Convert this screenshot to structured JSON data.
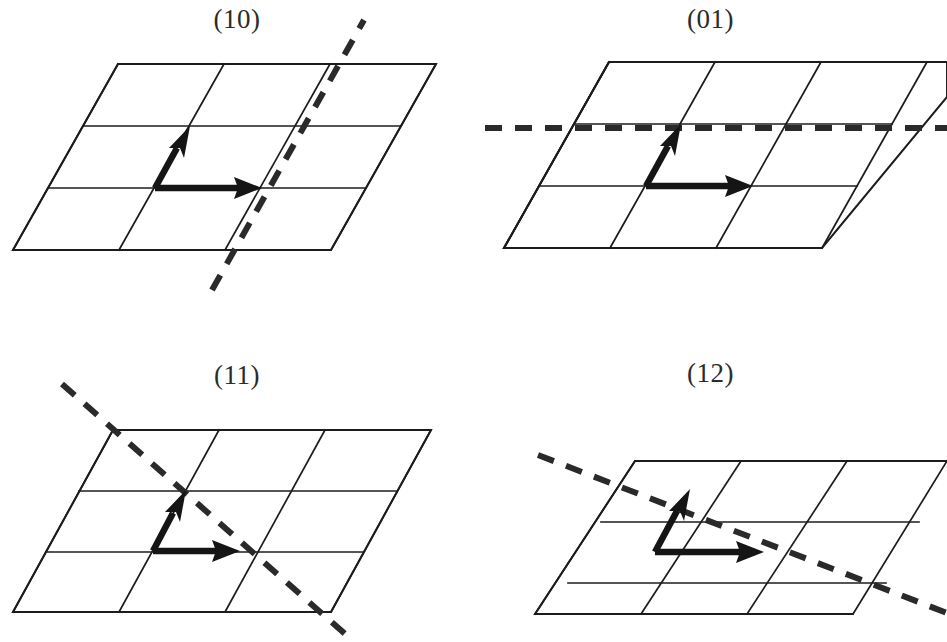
{
  "figure": {
    "type": "crystallographic-miller-index-diagram",
    "panel_count": 4,
    "columns": 2,
    "rows": 2
  },
  "style": {
    "background": "#ffffff",
    "lattice_stroke": "#1c1c1c",
    "trace_stroke": "#2a2a2a",
    "vector_fill": "#151515",
    "label_color": "#2b2b2b"
  },
  "lattice": {
    "cols": 3,
    "rows": 3,
    "cell_width": 106,
    "row_height": 62,
    "shear_per_row": -35,
    "basis_vector_a": {
      "dx": 106,
      "dy": 0,
      "name": "a"
    },
    "basis_vector_b": {
      "dx": 35,
      "dy": -62,
      "name": "b"
    }
  },
  "panels": [
    {
      "id": "panel-10",
      "label": "(10)",
      "miller_h": 1,
      "miller_k": 0,
      "label_x": 230,
      "label_y": 4,
      "origin_x": 13,
      "origin_y": 250,
      "vector_origin_x": 155,
      "vector_origin_y": 188,
      "trace": {
        "orientation": "parallel-to-b",
        "x1": 212,
        "y1": 290,
        "x2": 364,
        "y2": 20
      }
    },
    {
      "id": "panel-01",
      "label": "(01)",
      "miller_h": 0,
      "miller_k": 1,
      "label_x": 705,
      "label_y": 4,
      "origin_x": 504,
      "origin_y": 268,
      "vector_origin_x": 646,
      "vector_origin_y": 206,
      "trace": {
        "orientation": "parallel-to-a",
        "x1": 485,
        "y1": 128,
        "x2": 947,
        "y2": 128
      }
    },
    {
      "id": "panel-11",
      "label": "(11)",
      "miller_h": 1,
      "miller_k": 1,
      "label_x": 218,
      "label_y": 360,
      "origin_x": 13,
      "origin_y": 612,
      "vector_origin_x": 153,
      "vector_origin_y": 551,
      "trace": {
        "orientation": "through-both-vector-tips",
        "x1": 62,
        "y1": 384,
        "x2": 352,
        "y2": 640
      }
    },
    {
      "id": "panel-12",
      "label": "(12)",
      "miller_h": 1,
      "miller_k": 2,
      "label_x": 700,
      "label_y": 358,
      "origin_x": 513,
      "origin_y": 614,
      "vector_origin_x": 655,
      "vector_origin_y": 552,
      "trace": {
        "orientation": "through-a-tip-and-b-midpoint",
        "x1": 538,
        "y1": 455,
        "x2": 947,
        "y2": 613
      }
    }
  ]
}
